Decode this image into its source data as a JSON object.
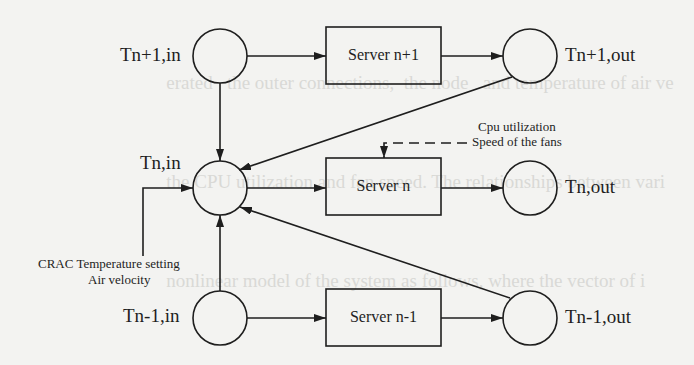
{
  "background_bleed_lines": [
    "                                   erated   the outer connections,  the node   and temperature of air ve",
    "                                   the CPU utilization and fan speed. The relationships between vari",
    "                                   nonlinear model of the system as follows, where the vector of i",
    "                                   by ...",
    "",
    "         )  = ( T          ,  T          ,  T          ,  T          )",
    "",
    "         model of an ARX ... to predict the server inlet temperature, K",
    "         matrix is K ... an integral multiple of the time ...",
    "         ... and ... Relationships used to predict server ...",
    "         ... and ... inlet temperature of ... predicted process can be ..."
  ],
  "nodes": {
    "in_next": {
      "label": "Tn+1,in"
    },
    "in_curr": {
      "label": "Tn,in"
    },
    "in_prev": {
      "label": "Tn-1,in"
    },
    "out_next": {
      "label": "Tn+1,out"
    },
    "out_curr": {
      "label": "Tn,out"
    },
    "out_prev": {
      "label": "Tn-1,out"
    }
  },
  "servers": {
    "next": {
      "label": "Server n+1"
    },
    "curr": {
      "label": "Server n"
    },
    "prev": {
      "label": "Server n-1"
    }
  },
  "inputs": {
    "server_control": {
      "line1": "Cpu utilization",
      "line2": "Speed of the fans"
    },
    "crac_control": {
      "line1": "CRAC Temperature setting",
      "line2": "Air velocity"
    }
  },
  "colors": {
    "stroke": "#1e1e1e",
    "background": "#f3f3f1"
  }
}
